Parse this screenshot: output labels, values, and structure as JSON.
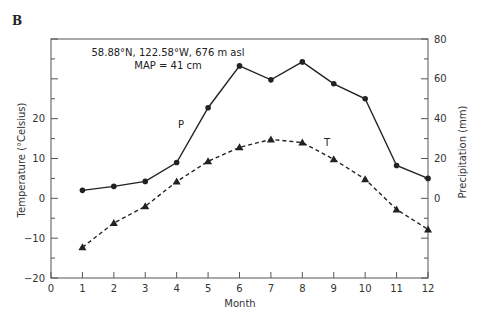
{
  "panel_label": "B",
  "annotation": {
    "line1": "58.88°N, 122.58°W, 676 m asl",
    "line2": "MAP = 41 cm"
  },
  "series_labels": {
    "precip": "P",
    "temp": "T"
  },
  "axes": {
    "x_title": "Month",
    "y_left_title": "Temperature (°Celsius)",
    "y_right_title": "Precipitation (mm)"
  },
  "colors": {
    "line": "#222222",
    "axis": "#555555"
  },
  "chart_data": {
    "type": "line",
    "title": "",
    "panel": "B",
    "annotations": [
      "58.88°N, 122.58°W, 676 m asl",
      "MAP = 41 cm",
      "P",
      "T"
    ],
    "xlabel": "Month",
    "ylabel_left": "Temperature (°Celsius)",
    "ylabel_right": "Precipitation (mm)",
    "x": [
      1,
      2,
      3,
      4,
      5,
      6,
      7,
      8,
      9,
      10,
      11,
      12
    ],
    "xlim": [
      0,
      12
    ],
    "x_ticks": [
      0,
      1,
      2,
      3,
      4,
      5,
      6,
      7,
      8,
      9,
      10,
      11,
      12
    ],
    "ylim_left": [
      -20,
      40
    ],
    "y_left_ticks_labeled": [
      -20,
      -10,
      0,
      10,
      20
    ],
    "ylim_right": [
      -40,
      80
    ],
    "y_right_ticks_labeled": [
      0,
      20,
      40,
      60,
      80
    ],
    "grid": false,
    "legend": "none (inline labels P and T)",
    "series": [
      {
        "name": "P",
        "label": "Precipitation (mm)",
        "axis": "right",
        "style": "solid",
        "marker": "circle",
        "values": [
          4,
          6,
          8.5,
          18,
          45.5,
          66.5,
          59.5,
          68.5,
          57.5,
          50,
          16.5,
          10
        ]
      },
      {
        "name": "T",
        "label": "Temperature (°C)",
        "axis": "left",
        "style": "dashed",
        "marker": "triangle",
        "values": [
          -12.3,
          -6.2,
          -2,
          4.2,
          9.3,
          12.8,
          14.8,
          14,
          9.8,
          4.8,
          -2.8,
          -7.8
        ]
      }
    ]
  }
}
